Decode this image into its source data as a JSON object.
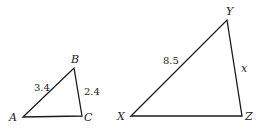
{
  "diagram": {
    "triangles": [
      {
        "name": "ABC",
        "vertices": [
          {
            "label": "A",
            "x": 23,
            "y": 117
          },
          {
            "label": "B",
            "x": 74,
            "y": 68
          },
          {
            "label": "C",
            "x": 82,
            "y": 116
          }
        ],
        "sides": [
          {
            "from": "A",
            "to": "B",
            "label": "3.4"
          },
          {
            "from": "B",
            "to": "C",
            "label": "2.4"
          },
          {
            "from": "A",
            "to": "C",
            "label": ""
          }
        ]
      },
      {
        "name": "XYZ",
        "vertices": [
          {
            "label": "X",
            "x": 131,
            "y": 116
          },
          {
            "label": "Y",
            "x": 227,
            "y": 20
          },
          {
            "label": "Z",
            "x": 242,
            "y": 116
          }
        ],
        "sides": [
          {
            "from": "X",
            "to": "Y",
            "label": "8.5"
          },
          {
            "from": "Y",
            "to": "Z",
            "label": "x"
          },
          {
            "from": "X",
            "to": "Z",
            "label": ""
          }
        ]
      }
    ]
  },
  "labels": {
    "A": "A",
    "B": "B",
    "C": "C",
    "X": "X",
    "Y": "Y",
    "Z": "Z",
    "AB": "3.4",
    "BC": "2.4",
    "XY": "8.5",
    "YZ": "x"
  }
}
